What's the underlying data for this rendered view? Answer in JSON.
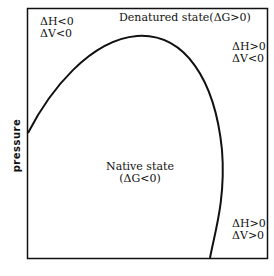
{
  "diagram": {
    "type": "phase-diagram",
    "y_axis_label": "pressure",
    "x_axis_label": "",
    "regions": {
      "denatured": "Denatured state(ΔG>0)",
      "native_line1": "Native state",
      "native_line2": "(ΔG<0)"
    },
    "annotations": {
      "top_left": [
        "ΔH<0",
        "ΔV<0"
      ],
      "top_right": [
        "ΔH>0",
        "ΔV<0"
      ],
      "bottom_right": [
        "ΔH>0",
        "ΔV>0"
      ]
    },
    "colors": {
      "line": "#111111",
      "background": "#ffffff"
    }
  }
}
